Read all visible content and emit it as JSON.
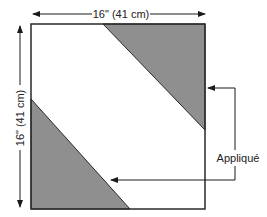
{
  "diagram": {
    "width_label": "16\" (41 cm)",
    "height_label": "16\" (41 cm)",
    "callout_label": "Appliqué",
    "colors": {
      "outline": "#2a2a2a",
      "applique_fill": "#8f8f8f",
      "background": "#ffffff"
    }
  }
}
